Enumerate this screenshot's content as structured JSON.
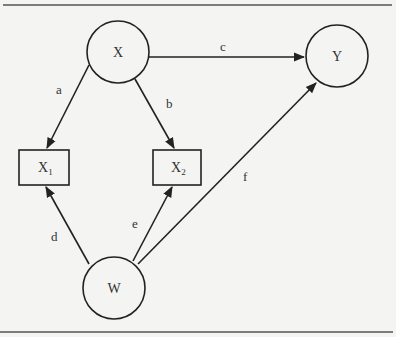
{
  "diagram": {
    "type": "path-diagram",
    "nodes": [
      {
        "id": "X",
        "label": "X",
        "subscript": "",
        "shape": "circle",
        "cx": 118,
        "cy": 52,
        "r": 31
      },
      {
        "id": "Y",
        "label": "Y",
        "subscript": "",
        "shape": "circle",
        "cx": 337,
        "cy": 56,
        "r": 31
      },
      {
        "id": "X1",
        "label": "X",
        "subscript": "1",
        "shape": "rect",
        "x": 19,
        "y": 150,
        "w": 50,
        "h": 35
      },
      {
        "id": "X2",
        "label": "X",
        "subscript": "2",
        "shape": "rect",
        "x": 153,
        "y": 150,
        "w": 48,
        "h": 35
      },
      {
        "id": "W",
        "label": "W",
        "subscript": "",
        "shape": "circle",
        "cx": 114,
        "cy": 288,
        "r": 31
      }
    ],
    "edges": [
      {
        "id": "a",
        "label": "a",
        "from": "X",
        "to": "X1"
      },
      {
        "id": "b",
        "label": "b",
        "from": "X",
        "to": "X2"
      },
      {
        "id": "c",
        "label": "c",
        "from": "X",
        "to": "Y"
      },
      {
        "id": "d",
        "label": "d",
        "from": "W",
        "to": "X1"
      },
      {
        "id": "e",
        "label": "e",
        "from": "W",
        "to": "X2"
      },
      {
        "id": "f",
        "label": "f",
        "from": "W",
        "to": "Y"
      }
    ]
  }
}
